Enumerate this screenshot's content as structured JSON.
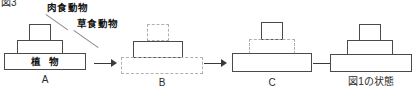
{
  "figure": {
    "number_label": "図3",
    "final_state_caption": "図1の状態"
  },
  "annotations": {
    "carnivore": "肉食動物",
    "herbivore": "草食動物",
    "plants": "植物"
  },
  "panels": [
    {
      "id": "A",
      "caption": "A",
      "tiers": [
        {
          "name": "carnivore",
          "style": "solid",
          "width": 22,
          "height": 17
        },
        {
          "name": "herbivore",
          "style": "solid",
          "width": 46,
          "height": 14
        },
        {
          "name": "plants",
          "style": "solid",
          "width": 82,
          "height": 17,
          "label": "植 物"
        }
      ]
    },
    {
      "id": "B",
      "caption": "B",
      "tiers": [
        {
          "name": "carnivore",
          "style": "dashed",
          "width": 22,
          "height": 17
        },
        {
          "name": "herbivore",
          "style": "solid",
          "width": 50,
          "height": 17
        },
        {
          "name": "plants",
          "style": "dashed",
          "width": 82,
          "height": 17
        }
      ]
    },
    {
      "id": "C",
      "caption": "C",
      "tiers": [
        {
          "name": "carnivore",
          "style": "solid",
          "width": 22,
          "height": 18
        },
        {
          "name": "herbivore",
          "style": "dashed",
          "width": 46,
          "height": 15
        },
        {
          "name": "plants",
          "style": "solid",
          "width": 80,
          "height": 19
        }
      ]
    },
    {
      "id": "D",
      "caption": "図1の状態",
      "tiers": [
        {
          "name": "carnivore",
          "style": "solid",
          "width": 22,
          "height": 17
        },
        {
          "name": "herbivore",
          "style": "solid",
          "width": 46,
          "height": 15
        },
        {
          "name": "plants",
          "style": "solid",
          "width": 82,
          "height": 18
        }
      ]
    }
  ],
  "arrows": [
    {
      "id": "arrow-a-b",
      "label": "→"
    },
    {
      "id": "arrow-b-c",
      "label": "→"
    },
    {
      "id": "arrow-c-d",
      "label": "→"
    }
  ],
  "colors": {
    "solid_border": "#4a4a4a",
    "dashed_border": "#b0b0b0",
    "arrow": "#3a3a3a",
    "text": "#111111",
    "background": "#ffffff"
  }
}
